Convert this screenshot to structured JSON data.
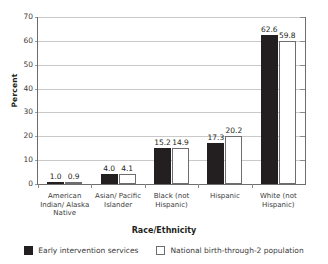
{
  "chart_data": {
    "type": "bar",
    "title": "",
    "cropped_top_title": "",
    "xlabel": "Race/Ethnicity",
    "ylabel": "Percent",
    "ylim": [
      0,
      70
    ],
    "yticks": [
      0,
      10,
      20,
      30,
      40,
      50,
      60,
      70
    ],
    "ytick_labels": [
      "0",
      "10",
      "20",
      "30",
      "40",
      "50",
      "60",
      "70"
    ],
    "grid": true,
    "legend_position": "bottom",
    "categories": [
      "American\nIndian/ Alaska\nNative",
      "Asian/ Pacific\nIslander",
      "Black (not\nHispanic)",
      "Hispanic",
      "White (not\nHispanic)"
    ],
    "series": [
      {
        "name": "Early intervention services",
        "color": "#231f20",
        "values": [
          1.0,
          4.0,
          15.2,
          17.3,
          62.6
        ],
        "labels": [
          "1.0",
          "4.0",
          "15.2",
          "17.3",
          "62.6"
        ]
      },
      {
        "name": "National birth-through-2 population",
        "color": "#ffffff",
        "border_color": "#6d6d6d",
        "values": [
          0.9,
          4.1,
          14.9,
          20.2,
          59.8
        ],
        "labels": [
          "0.9",
          "4.1",
          "14.9",
          "20.2",
          "59.8"
        ]
      }
    ]
  },
  "colors": {
    "series_dark": "#231f20",
    "series_light": "#ffffff",
    "gridline": "#c9c9c9",
    "axis": "#6d6d6d",
    "background": "#ffffff"
  }
}
